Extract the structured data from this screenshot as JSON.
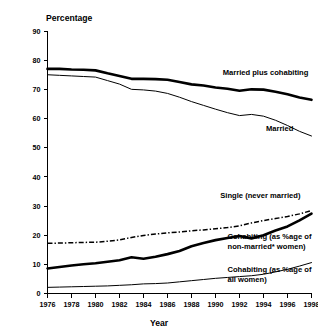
{
  "chart_data": {
    "type": "line",
    "title": "",
    "ylabel": "Percentage",
    "xlabel": "Year",
    "ylim": [
      0,
      90
    ],
    "xlim": [
      1976,
      1998
    ],
    "grid": false,
    "legend_position": "inline-annotations",
    "y_ticks": [
      "0",
      "10",
      "20",
      "30",
      "40",
      "50",
      "60",
      "70",
      "80",
      "90"
    ],
    "x_ticks": [
      "1976",
      "1978",
      "1980",
      "1982",
      "1984",
      "1986",
      "1988",
      "1990",
      "1992",
      "1994",
      "1996",
      "1998"
    ],
    "x": [
      1976,
      1977,
      1978,
      1979,
      1980,
      1981,
      1982,
      1983,
      1984,
      1985,
      1986,
      1987,
      1988,
      1989,
      1990,
      1991,
      1992,
      1993,
      1994,
      1995,
      1996,
      1997,
      1998
    ],
    "series": [
      {
        "name": "Married plus cohabiting",
        "style": "thick-solid",
        "label": "Married plus cohabiting",
        "values": [
          77.0,
          77.0,
          76.8,
          76.7,
          76.5,
          75.5,
          74.6,
          73.6,
          73.6,
          73.5,
          73.3,
          72.5,
          71.7,
          71.3,
          70.6,
          70.2,
          69.5,
          70.0,
          69.9,
          69.2,
          68.3,
          67.2,
          66.4
        ]
      },
      {
        "name": "Married",
        "style": "thin-solid",
        "label": "Married",
        "values": [
          75.0,
          74.8,
          74.6,
          74.4,
          74.2,
          73.0,
          71.8,
          70.0,
          69.8,
          69.4,
          68.6,
          67.3,
          65.8,
          64.5,
          63.2,
          62.0,
          61.0,
          61.4,
          60.8,
          59.4,
          57.6,
          55.6,
          54.0
        ]
      },
      {
        "name": "Single (never married)",
        "style": "dash-dot",
        "label": "Single (never married)",
        "values": [
          17.2,
          17.3,
          17.4,
          17.5,
          17.6,
          17.9,
          18.4,
          19.2,
          19.9,
          20.4,
          20.8,
          21.1,
          21.5,
          21.8,
          22.2,
          22.6,
          23.2,
          24.2,
          25.0,
          25.7,
          26.4,
          27.3,
          28.4
        ]
      },
      {
        "name": "Cohabiting (as %age of non-married* women)",
        "style": "thick-solid",
        "label_lines": [
          "Cohabiting (as %age of",
          "non-married* women)"
        ],
        "values": [
          8.6,
          9.1,
          9.6,
          10.0,
          10.4,
          10.9,
          11.4,
          12.4,
          11.9,
          12.6,
          13.5,
          14.6,
          16.2,
          17.3,
          18.3,
          19.0,
          19.7,
          18.9,
          20.0,
          21.6,
          23.0,
          25.1,
          27.4
        ]
      },
      {
        "name": "Cohabiting (as %age of all women)",
        "style": "thin-solid",
        "label_lines": [
          "Cohabiting (as %age of",
          "all women)"
        ],
        "values": [
          2.1,
          2.2,
          2.3,
          2.4,
          2.5,
          2.6,
          2.8,
          3.0,
          3.3,
          3.4,
          3.6,
          4.0,
          4.4,
          4.8,
          5.2,
          5.5,
          5.8,
          6.1,
          6.6,
          7.4,
          8.3,
          9.4,
          10.6
        ]
      }
    ],
    "annotations": [
      {
        "text": "Married plus cohabiting",
        "x": 1990.6,
        "y": 75.0
      },
      {
        "text": "Married",
        "x": 1994.2,
        "y": 55.8
      },
      {
        "text": "Single (never married)",
        "x": 1990.4,
        "y": 32.6
      },
      {
        "text": "Cohabiting (as %age of",
        "x": 1991.0,
        "y": 18.6
      },
      {
        "text": "non-married* women)",
        "x": 1991.0,
        "y": 15.2
      },
      {
        "text": "Cohabiting (as %age of",
        "x": 1991.0,
        "y": 7.4
      },
      {
        "text": "all women)",
        "x": 1991.0,
        "y": 4.0
      }
    ]
  }
}
